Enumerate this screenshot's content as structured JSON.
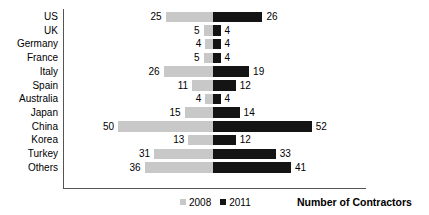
{
  "chart_data": {
    "type": "bar",
    "orientation": "horizontal-diverging",
    "title": "",
    "subtitle": "",
    "xlabel": "Number of Contractors",
    "ylabel": "",
    "grid": false,
    "legend_position": "bottom-center",
    "axis_center_value": 0,
    "px_per_unit": 1.9,
    "categories": [
      "US",
      "UK",
      "Germany",
      "France",
      "Italy",
      "Spain",
      "Australia",
      "Japan",
      "China",
      "Korea",
      "Turkey",
      "Others"
    ],
    "series": [
      {
        "name": "2008",
        "color": "#c8c8c8",
        "side": "left",
        "values": [
          25,
          5,
          4,
          5,
          26,
          11,
          4,
          15,
          50,
          13,
          31,
          36
        ]
      },
      {
        "name": "2011",
        "color": "#141414",
        "side": "right",
        "values": [
          26,
          4,
          4,
          4,
          19,
          12,
          4,
          14,
          52,
          12,
          33,
          41
        ]
      }
    ],
    "legend": [
      {
        "label": "2008",
        "color": "#c8c8c8"
      },
      {
        "label": "2011",
        "color": "#141414"
      }
    ]
  }
}
